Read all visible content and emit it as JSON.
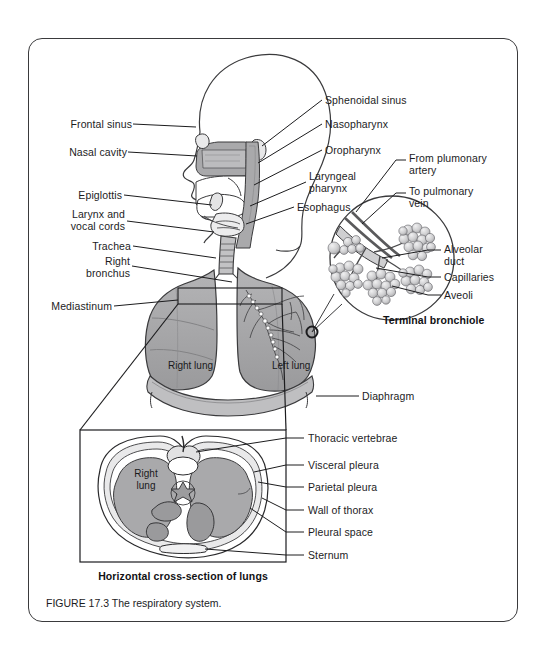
{
  "figure": {
    "caption": "FIGURE 17.3 The respiratory system.",
    "inset_caption_upper": "Terminal bronchiole",
    "inset_caption_lower": "Horizontal cross-section of lungs"
  },
  "labels_left": [
    {
      "id": "frontal-sinus",
      "text": "Frontal sinus",
      "x": 62,
      "y": 124,
      "line_to_x": 196,
      "line_to_y": 128
    },
    {
      "id": "nasal-cavity",
      "text": "Nasal cavity",
      "x": 62,
      "y": 152,
      "line_to_x": 197,
      "line_to_y": 157
    },
    {
      "id": "epiglottis",
      "text": "Epiglottis",
      "x": 86,
      "y": 195,
      "line_to_x": 205,
      "line_to_y": 204
    },
    {
      "id": "larynx-vocal",
      "text": "Larynx and\nvocal cords",
      "x": 70,
      "y": 211,
      "line_to_x": 209,
      "line_to_y": 231
    },
    {
      "id": "trachea",
      "text": "Trachea",
      "x": 92,
      "y": 246,
      "line_to_x": 215,
      "line_to_y": 258
    },
    {
      "id": "right-bronchus",
      "text": "Right\nbronchus",
      "x": 83,
      "y": 258,
      "line_to_x": 229,
      "line_to_y": 281
    },
    {
      "id": "mediastinum",
      "text": "Mediastinum",
      "x": 48,
      "y": 306,
      "line_to_x": 182,
      "line_to_y": 310
    }
  ],
  "labels_right_head": [
    {
      "id": "sphenoidal-sinus",
      "text": "Sphenoidal sinus",
      "x": 325,
      "y": 100,
      "line_to_x": 260,
      "line_to_y": 147
    },
    {
      "id": "nasopharynx",
      "text": "Nasopharynx",
      "x": 325,
      "y": 124,
      "line_to_x": 255,
      "line_to_y": 164
    },
    {
      "id": "oropharynx",
      "text": "Oropharynx",
      "x": 325,
      "y": 150,
      "line_to_x": 252,
      "line_to_y": 186
    },
    {
      "id": "laryngeal-pharynx",
      "text": "Laryngeal\npharynx",
      "x": 310,
      "y": 176,
      "line_to_x": 248,
      "line_to_y": 207
    },
    {
      "id": "esophagus",
      "text": "Esophagus",
      "x": 297,
      "y": 207,
      "line_to_x": 244,
      "line_to_y": 225
    }
  ],
  "labels_right_alveoli": [
    {
      "id": "from-pulmonary-artery",
      "text": "From plumonary\nartery",
      "x": 409,
      "y": 157
    },
    {
      "id": "to-pulmonary-vein",
      "text": "To pulmonary\nvein",
      "x": 409,
      "y": 190
    },
    {
      "id": "alveolar-duct",
      "text": "Alveolar\nduct",
      "x": 444,
      "y": 245
    },
    {
      "id": "capillaries",
      "text": "Capillaries",
      "x": 444,
      "y": 273
    },
    {
      "id": "aveoli",
      "text": "Aveoli",
      "x": 444,
      "y": 291
    }
  ],
  "labels_lung_onart": [
    {
      "id": "right-lung",
      "text": "Right lung",
      "x": 168,
      "y": 366
    },
    {
      "id": "left-lung",
      "text": "Left lung",
      "x": 272,
      "y": 366
    },
    {
      "id": "diaphragm",
      "text": "Diaphragm",
      "x": 362,
      "y": 392
    }
  ],
  "labels_cross_section": [
    {
      "id": "thoracic-vertebrae",
      "text": "Thoracic vertebrae",
      "x": 307,
      "y": 434,
      "tick_y": 438
    },
    {
      "id": "visceral-pleura",
      "text": "Visceral pleura",
      "x": 307,
      "y": 461,
      "tick_y": 465
    },
    {
      "id": "parietal-pleura",
      "text": "Parietal pleura",
      "x": 307,
      "y": 483,
      "tick_y": 487
    },
    {
      "id": "wall-of-thorax",
      "text": "Wall of thorax",
      "x": 307,
      "y": 506,
      "tick_y": 510
    },
    {
      "id": "pleural-space",
      "text": "Pleural space",
      "x": 307,
      "y": 528,
      "tick_y": 532
    },
    {
      "id": "sternum",
      "text": "Sternum",
      "x": 307,
      "y": 551,
      "tick_y": 555
    }
  ],
  "cross_section_onart": [
    {
      "id": "cs-right-lung",
      "text": "Right\nlung",
      "x": 110,
      "y": 474
    }
  ],
  "colors": {
    "ink": "#1c1c1e",
    "frame": "#3a3a3c",
    "lung_fill": "#a9a9ab",
    "lung_fill_dark": "#939395",
    "tissue_fill": "#b9b9bb",
    "alveoli_fill": "#d3d3d5",
    "page_bg": "#ffffff"
  }
}
